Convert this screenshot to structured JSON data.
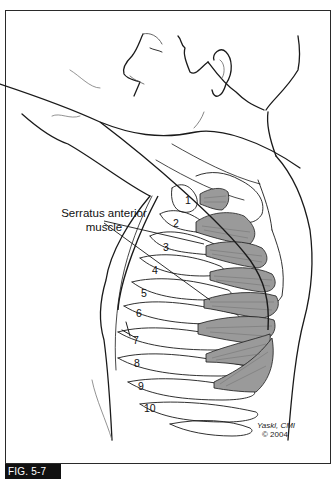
{
  "figure": {
    "label": "FIG. 5-7",
    "callout": {
      "line1": "Serratus anterior",
      "line2": "muscle"
    },
    "rib_labels": [
      "1",
      "2",
      "3",
      "4",
      "5",
      "6",
      "7",
      "8",
      "9",
      "10"
    ],
    "signature": "Yaskl, CMI",
    "copyright": "© 2004",
    "colors": {
      "outline": "#1a1a1a",
      "muscle_fill": "#9a9a9a",
      "muscle_striation": "#6e6e6e",
      "label_bg": "#111111",
      "label_text": "#ffffff"
    }
  }
}
